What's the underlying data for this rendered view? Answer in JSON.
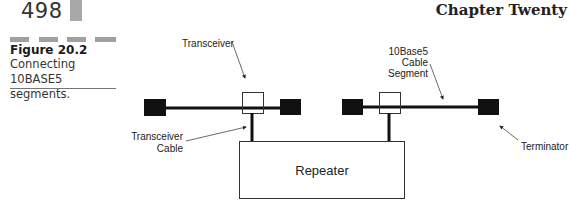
{
  "header": {
    "page_number": "498",
    "chapter_title": "Chapter Twenty"
  },
  "figure": {
    "label": "Figure 20.2",
    "caption": "Connecting 10BASE5 segments."
  },
  "diagram": {
    "labels": {
      "transceiver": "Transceiver",
      "transceiver_cable_line1": "Transceiver",
      "transceiver_cable_line2": "Cable",
      "segment_line1": "10Base5",
      "segment_line2": "Cable",
      "segment_line3": "Segment",
      "repeater": "Repeater",
      "terminator": "Terminator"
    },
    "colors": {
      "terminator_fill": "#111111",
      "cable": "#111111",
      "box_stroke": "#333333"
    }
  }
}
